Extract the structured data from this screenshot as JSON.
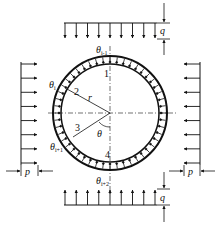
{
  "figure": {
    "labels": {
      "q_top": "q",
      "q_bottom": "q",
      "p_left": "p",
      "p_right": "p",
      "theta_top": "θ",
      "theta_top_sub": "i-1",
      "theta_i": "θ",
      "theta_i_sub": "i",
      "theta_i1": "θ",
      "theta_i1_sub": "i+1",
      "theta_bottom": "θ",
      "theta_bottom_sub": "i+2",
      "theta_center": "θ",
      "radius": "r",
      "node_1": "1",
      "node_2": "2",
      "node_3": "3",
      "node_4": "4"
    },
    "colors": {
      "stroke": "#111111",
      "background": "#ffffff"
    },
    "geometry": {
      "center": [
        110,
        113
      ],
      "outer_radius": 57,
      "inner_radius": 49,
      "top_arrow_count": 9,
      "side_arrow_count": 8
    }
  }
}
